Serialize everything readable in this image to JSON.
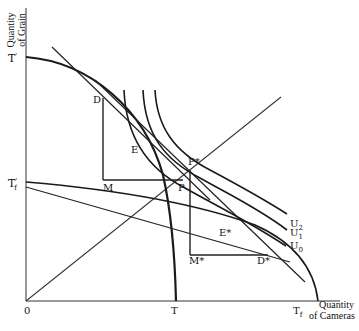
{
  "diagram": {
    "y_axis_title": [
      "Quantity",
      "of Grain"
    ],
    "x_axis_title": [
      "Quantity",
      "of Cameras"
    ],
    "origin_label": "0",
    "axis_ticks": {
      "y_top": {
        "base": "T",
        "sup": "'"
      },
      "y_mid": {
        "base": "T",
        "sup": "'",
        "sub": "f"
      },
      "x_mid": "T",
      "x_right": {
        "base": "T",
        "sub": "f"
      }
    },
    "points": {
      "D": "D",
      "E": "E",
      "M": "M",
      "P": "P",
      "P_star": "P*",
      "E_star": "E*",
      "M_star": "M*",
      "D_star": "D*"
    },
    "indifference_curves": [
      {
        "base": "U",
        "sub": "2"
      },
      {
        "base": "U",
        "sub": "1"
      },
      {
        "base": "U",
        "sub": "0"
      }
    ],
    "colors": {
      "stroke": "#1a1a1a",
      "background": "#ffffff"
    }
  }
}
